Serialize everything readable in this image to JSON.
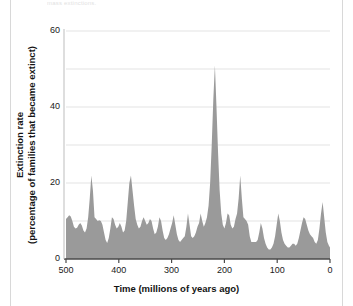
{
  "figure": {
    "caption_remnant": "mass extinctions.",
    "background_color": "#ffffff"
  },
  "chart_data": {
    "type": "area",
    "title": "",
    "subtitle": "",
    "xlabel": "Time  (millions of years ago)",
    "ylabel": "Extinction rate\n(percentage of families that became extinct)",
    "ylabel_line1": "Extinction rate",
    "ylabel_line2": "(percentage of families that became extinct)",
    "xlim": [
      500,
      0
    ],
    "ylim": [
      0,
      60
    ],
    "x_axis_reversed": true,
    "xticks": [
      500,
      400,
      300,
      200,
      100,
      0
    ],
    "yticks": [
      0,
      20,
      40,
      60
    ],
    "grid": "horizontal-minor-and-major",
    "gridlines_y": [
      10,
      20,
      30,
      40,
      50,
      60
    ],
    "legend": "none",
    "legend_position": "none",
    "series_name": "Marine family extinction rate",
    "fill_color": "#9a9a9a",
    "grid_color": "#e3e3e3",
    "axis_color": "#4a4a4a",
    "x": [
      500,
      497,
      494,
      491,
      488,
      485,
      482,
      479,
      476,
      473,
      470,
      467,
      464,
      461,
      458,
      455,
      452,
      449,
      446,
      443,
      440,
      437,
      434,
      431,
      428,
      425,
      422,
      419,
      416,
      413,
      410,
      407,
      404,
      401,
      398,
      395,
      392,
      389,
      386,
      383,
      380,
      377,
      374,
      371,
      368,
      365,
      362,
      359,
      356,
      353,
      350,
      347,
      344,
      341,
      338,
      335,
      332,
      329,
      326,
      323,
      320,
      317,
      314,
      311,
      308,
      305,
      302,
      299,
      296,
      293,
      290,
      287,
      284,
      281,
      278,
      275,
      272,
      269,
      266,
      263,
      260,
      257,
      254,
      251,
      248,
      245,
      242,
      239,
      236,
      233,
      230,
      227,
      224,
      221,
      218,
      215,
      212,
      209,
      206,
      203,
      200,
      197,
      194,
      191,
      188,
      185,
      182,
      179,
      176,
      173,
      170,
      167,
      164,
      161,
      158,
      155,
      152,
      149,
      146,
      143,
      140,
      137,
      134,
      131,
      128,
      125,
      122,
      119,
      116,
      113,
      110,
      107,
      104,
      101,
      98,
      95,
      92,
      89,
      86,
      83,
      80,
      77,
      74,
      71,
      68,
      65,
      62,
      59,
      56,
      53,
      50,
      47,
      44,
      41,
      38,
      35,
      32,
      29,
      26,
      23,
      20,
      17,
      14,
      11,
      8,
      5,
      2,
      0
    ],
    "y": [
      10.5,
      11.0,
      11.5,
      11.2,
      10.0,
      8.5,
      8.0,
      8.2,
      9.0,
      9.5,
      8.8,
      7.5,
      7.0,
      8.0,
      11.0,
      16.0,
      22.0,
      18.0,
      11.0,
      10.5,
      10.0,
      10.2,
      10.0,
      9.0,
      7.0,
      5.0,
      4.2,
      5.5,
      8.0,
      11.0,
      10.5,
      9.0,
      8.0,
      8.5,
      9.5,
      8.5,
      7.0,
      7.5,
      10.0,
      15.0,
      20.0,
      22.0,
      18.0,
      14.0,
      10.5,
      9.0,
      8.0,
      8.5,
      10.0,
      11.0,
      10.0,
      9.0,
      9.5,
      10.5,
      10.0,
      8.0,
      6.5,
      7.0,
      8.5,
      11.0,
      10.0,
      7.5,
      5.5,
      5.0,
      5.5,
      6.5,
      8.0,
      9.5,
      11.5,
      9.0,
      6.5,
      5.0,
      4.5,
      5.0,
      5.5,
      6.0,
      8.5,
      12.0,
      9.0,
      6.0,
      5.5,
      6.0,
      7.0,
      8.5,
      9.5,
      12.0,
      10.0,
      8.5,
      9.5,
      11.0,
      14.0,
      20.0,
      30.0,
      42.0,
      51.0,
      40.0,
      28.0,
      18.0,
      12.0,
      9.0,
      8.0,
      9.5,
      12.0,
      11.5,
      9.0,
      8.0,
      8.5,
      10.5,
      12.0,
      16.0,
      22.0,
      16.0,
      11.0,
      10.5,
      10.0,
      9.0,
      6.0,
      4.5,
      4.5,
      4.5,
      4.5,
      5.0,
      7.0,
      9.5,
      8.0,
      5.5,
      4.0,
      3.0,
      2.5,
      2.5,
      3.0,
      4.0,
      6.0,
      9.0,
      12.0,
      10.0,
      7.0,
      5.0,
      4.0,
      3.5,
      3.0,
      3.0,
      3.5,
      4.0,
      4.0,
      3.5,
      4.0,
      5.5,
      7.5,
      9.5,
      11.0,
      10.5,
      9.0,
      7.5,
      6.5,
      6.0,
      5.5,
      4.5,
      4.0,
      5.0,
      8.0,
      12.0,
      15.0,
      11.0,
      7.0,
      4.5,
      3.5,
      3.0,
      3.5,
      4.0,
      3.5,
      3.0,
      3.5,
      4.0,
      3.5,
      2.5,
      2.0,
      2.5,
      3.0,
      3.5,
      3.0,
      2.5,
      2.0,
      1.8,
      1.5,
      1.2,
      1.0,
      1.5,
      1.0
    ]
  }
}
